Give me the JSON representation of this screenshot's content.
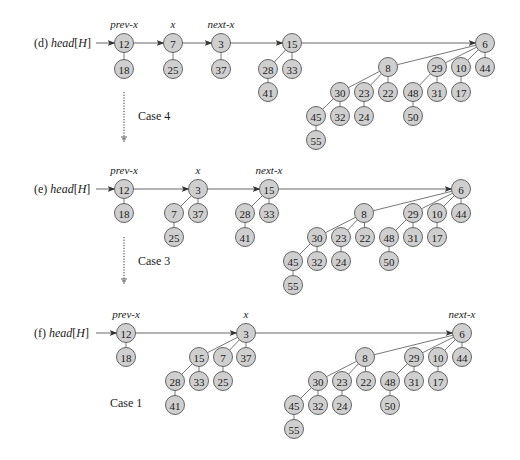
{
  "figure": {
    "colors": {
      "node_fill": "#cfcfcf",
      "node_stroke": "#555555",
      "line": "#555555",
      "text": "#1a1a1a"
    },
    "rows": [
      {
        "id": "d",
        "label_prefix": "(d)",
        "label_main": "head",
        "label_bracket": "[H]",
        "y": 43,
        "pointers": [
          {
            "label": "prev-x",
            "node": "n12"
          },
          {
            "label": "x",
            "node": "n7"
          },
          {
            "label": "next-x",
            "node": "n3"
          }
        ],
        "nodes": [
          {
            "id": "n12",
            "key": "12",
            "x": 124,
            "y": 43
          },
          {
            "id": "n18",
            "key": "18",
            "x": 124,
            "y": 69
          },
          {
            "id": "n7",
            "key": "7",
            "x": 173,
            "y": 43
          },
          {
            "id": "n25",
            "key": "25",
            "x": 173,
            "y": 69
          },
          {
            "id": "n3",
            "key": "3",
            "x": 221,
            "y": 43
          },
          {
            "id": "n37",
            "key": "37",
            "x": 221,
            "y": 69
          },
          {
            "id": "n15",
            "key": "15",
            "x": 292,
            "y": 43
          },
          {
            "id": "n28",
            "key": "28",
            "x": 268,
            "y": 69
          },
          {
            "id": "n33",
            "key": "33",
            "x": 292,
            "y": 69
          },
          {
            "id": "n41",
            "key": "41",
            "x": 268,
            "y": 92
          },
          {
            "id": "n6",
            "key": "6",
            "x": 485,
            "y": 43
          },
          {
            "id": "n8",
            "key": "8",
            "x": 388,
            "y": 67
          },
          {
            "id": "n29",
            "key": "29",
            "x": 437,
            "y": 67
          },
          {
            "id": "n10",
            "key": "10",
            "x": 461,
            "y": 67
          },
          {
            "id": "n44",
            "key": "44",
            "x": 485,
            "y": 67
          },
          {
            "id": "n30",
            "key": "30",
            "x": 340,
            "y": 92
          },
          {
            "id": "n23",
            "key": "23",
            "x": 364,
            "y": 92
          },
          {
            "id": "n22",
            "key": "22",
            "x": 388,
            "y": 92
          },
          {
            "id": "n48",
            "key": "48",
            "x": 413,
            "y": 92
          },
          {
            "id": "n31",
            "key": "31",
            "x": 437,
            "y": 92
          },
          {
            "id": "n17",
            "key": "17",
            "x": 461,
            "y": 92
          },
          {
            "id": "n45",
            "key": "45",
            "x": 316,
            "y": 116
          },
          {
            "id": "n32",
            "key": "32",
            "x": 340,
            "y": 116
          },
          {
            "id": "n24",
            "key": "24",
            "x": 364,
            "y": 116
          },
          {
            "id": "n50",
            "key": "50",
            "x": 413,
            "y": 116
          },
          {
            "id": "n55",
            "key": "55",
            "x": 316,
            "y": 140
          }
        ],
        "edges": [
          [
            "n12",
            "n18"
          ],
          [
            "n7",
            "n25"
          ],
          [
            "n3",
            "n37"
          ],
          [
            "n15",
            "n28"
          ],
          [
            "n15",
            "n33"
          ],
          [
            "n28",
            "n41"
          ],
          [
            "n6",
            "n8"
          ],
          [
            "n6",
            "n29"
          ],
          [
            "n6",
            "n10"
          ],
          [
            "n6",
            "n44"
          ],
          [
            "n8",
            "n30"
          ],
          [
            "n8",
            "n23"
          ],
          [
            "n8",
            "n22"
          ],
          [
            "n29",
            "n48"
          ],
          [
            "n29",
            "n31"
          ],
          [
            "n10",
            "n17"
          ],
          [
            "n30",
            "n45"
          ],
          [
            "n30",
            "n32"
          ],
          [
            "n23",
            "n24"
          ],
          [
            "n48",
            "n50"
          ],
          [
            "n45",
            "n55"
          ]
        ],
        "root_list": [
          "n12",
          "n7",
          "n3",
          "n15",
          "n6"
        ],
        "transition": {
          "label": "Case 4",
          "x": 124,
          "y1": 92,
          "y2": 140,
          "label_x": 138,
          "label_y": 120
        }
      },
      {
        "id": "e",
        "label_prefix": "(e)",
        "label_main": "head",
        "label_bracket": "[H]",
        "y": 189,
        "pointers": [
          {
            "label": "prev-x",
            "node": "n12"
          },
          {
            "label": "x",
            "node": "n3"
          },
          {
            "label": "next-x",
            "node": "n15"
          }
        ],
        "nodes": [
          {
            "id": "n12",
            "key": "12",
            "x": 124,
            "y": 189
          },
          {
            "id": "n18",
            "key": "18",
            "x": 124,
            "y": 213
          },
          {
            "id": "n3",
            "key": "3",
            "x": 198,
            "y": 189
          },
          {
            "id": "n7",
            "key": "7",
            "x": 174,
            "y": 213
          },
          {
            "id": "n37",
            "key": "37",
            "x": 198,
            "y": 213
          },
          {
            "id": "n25",
            "key": "25",
            "x": 174,
            "y": 237
          },
          {
            "id": "n15",
            "key": "15",
            "x": 269,
            "y": 189
          },
          {
            "id": "n28",
            "key": "28",
            "x": 245,
            "y": 213
          },
          {
            "id": "n33",
            "key": "33",
            "x": 269,
            "y": 213
          },
          {
            "id": "n41",
            "key": "41",
            "x": 245,
            "y": 237
          },
          {
            "id": "n6",
            "key": "6",
            "x": 461,
            "y": 189
          },
          {
            "id": "n8",
            "key": "8",
            "x": 364,
            "y": 213
          },
          {
            "id": "n29",
            "key": "29",
            "x": 413,
            "y": 213
          },
          {
            "id": "n10",
            "key": "10",
            "x": 437,
            "y": 213
          },
          {
            "id": "n44",
            "key": "44",
            "x": 461,
            "y": 213
          },
          {
            "id": "n30",
            "key": "30",
            "x": 317,
            "y": 237
          },
          {
            "id": "n23",
            "key": "23",
            "x": 341,
            "y": 237
          },
          {
            "id": "n22",
            "key": "22",
            "x": 365,
            "y": 237
          },
          {
            "id": "n48",
            "key": "48",
            "x": 389,
            "y": 237
          },
          {
            "id": "n31",
            "key": "31",
            "x": 413,
            "y": 237
          },
          {
            "id": "n17",
            "key": "17",
            "x": 437,
            "y": 237
          },
          {
            "id": "n45",
            "key": "45",
            "x": 293,
            "y": 261
          },
          {
            "id": "n32",
            "key": "32",
            "x": 317,
            "y": 261
          },
          {
            "id": "n24",
            "key": "24",
            "x": 341,
            "y": 261
          },
          {
            "id": "n50",
            "key": "50",
            "x": 389,
            "y": 261
          },
          {
            "id": "n55",
            "key": "55",
            "x": 293,
            "y": 285
          }
        ],
        "edges": [
          [
            "n12",
            "n18"
          ],
          [
            "n3",
            "n7"
          ],
          [
            "n3",
            "n37"
          ],
          [
            "n7",
            "n25"
          ],
          [
            "n15",
            "n28"
          ],
          [
            "n15",
            "n33"
          ],
          [
            "n28",
            "n41"
          ],
          [
            "n6",
            "n8"
          ],
          [
            "n6",
            "n29"
          ],
          [
            "n6",
            "n10"
          ],
          [
            "n6",
            "n44"
          ],
          [
            "n8",
            "n30"
          ],
          [
            "n8",
            "n23"
          ],
          [
            "n8",
            "n22"
          ],
          [
            "n29",
            "n48"
          ],
          [
            "n29",
            "n31"
          ],
          [
            "n10",
            "n17"
          ],
          [
            "n30",
            "n45"
          ],
          [
            "n30",
            "n32"
          ],
          [
            "n23",
            "n24"
          ],
          [
            "n48",
            "n50"
          ],
          [
            "n45",
            "n55"
          ]
        ],
        "root_list": [
          "n12",
          "n3",
          "n15",
          "n6"
        ],
        "transition": {
          "label": "Case 3",
          "x": 124,
          "y1": 237,
          "y2": 282,
          "label_x": 138,
          "label_y": 265
        }
      },
      {
        "id": "f",
        "label_prefix": "(f)",
        "label_main": "head",
        "label_bracket": "[H]",
        "y": 333,
        "pointers": [
          {
            "label": "prev-x",
            "node": "n12"
          },
          {
            "label": "x",
            "node": "n3"
          },
          {
            "label": "next-x",
            "node": "n6"
          }
        ],
        "nodes": [
          {
            "id": "n12",
            "key": "12",
            "x": 126,
            "y": 333
          },
          {
            "id": "n18",
            "key": "18",
            "x": 126,
            "y": 357
          },
          {
            "id": "n3",
            "key": "3",
            "x": 246,
            "y": 333
          },
          {
            "id": "n15",
            "key": "15",
            "x": 199,
            "y": 357
          },
          {
            "id": "n7",
            "key": "7",
            "x": 223,
            "y": 357
          },
          {
            "id": "n37",
            "key": "37",
            "x": 246,
            "y": 357
          },
          {
            "id": "n28",
            "key": "28",
            "x": 175,
            "y": 381
          },
          {
            "id": "n33",
            "key": "33",
            "x": 199,
            "y": 381
          },
          {
            "id": "n25",
            "key": "25",
            "x": 223,
            "y": 381
          },
          {
            "id": "n41",
            "key": "41",
            "x": 175,
            "y": 405
          },
          {
            "id": "n6",
            "key": "6",
            "x": 462,
            "y": 333
          },
          {
            "id": "n8",
            "key": "8",
            "x": 365,
            "y": 357
          },
          {
            "id": "n29",
            "key": "29",
            "x": 414,
            "y": 357
          },
          {
            "id": "n10",
            "key": "10",
            "x": 438,
            "y": 357
          },
          {
            "id": "n44",
            "key": "44",
            "x": 462,
            "y": 357
          },
          {
            "id": "n30",
            "key": "30",
            "x": 318,
            "y": 381
          },
          {
            "id": "n23",
            "key": "23",
            "x": 342,
            "y": 381
          },
          {
            "id": "n22",
            "key": "22",
            "x": 366,
            "y": 381
          },
          {
            "id": "n48",
            "key": "48",
            "x": 390,
            "y": 381
          },
          {
            "id": "n31",
            "key": "31",
            "x": 414,
            "y": 381
          },
          {
            "id": "n17",
            "key": "17",
            "x": 438,
            "y": 381
          },
          {
            "id": "n45",
            "key": "45",
            "x": 294,
            "y": 405
          },
          {
            "id": "n32",
            "key": "32",
            "x": 318,
            "y": 405
          },
          {
            "id": "n24",
            "key": "24",
            "x": 342,
            "y": 405
          },
          {
            "id": "n50",
            "key": "50",
            "x": 390,
            "y": 405
          },
          {
            "id": "n55",
            "key": "55",
            "x": 294,
            "y": 429
          }
        ],
        "edges": [
          [
            "n12",
            "n18"
          ],
          [
            "n3",
            "n15"
          ],
          [
            "n3",
            "n7"
          ],
          [
            "n3",
            "n37"
          ],
          [
            "n15",
            "n28"
          ],
          [
            "n15",
            "n33"
          ],
          [
            "n7",
            "n25"
          ],
          [
            "n28",
            "n41"
          ],
          [
            "n6",
            "n8"
          ],
          [
            "n6",
            "n29"
          ],
          [
            "n6",
            "n10"
          ],
          [
            "n6",
            "n44"
          ],
          [
            "n8",
            "n30"
          ],
          [
            "n8",
            "n23"
          ],
          [
            "n8",
            "n22"
          ],
          [
            "n29",
            "n48"
          ],
          [
            "n29",
            "n31"
          ],
          [
            "n10",
            "n17"
          ],
          [
            "n30",
            "n45"
          ],
          [
            "n30",
            "n32"
          ],
          [
            "n23",
            "n24"
          ],
          [
            "n48",
            "n50"
          ],
          [
            "n45",
            "n55"
          ]
        ],
        "root_list": [
          "n12",
          "n3",
          "n6"
        ],
        "case_note": {
          "label": "Case 1",
          "x": 110,
          "y": 407
        }
      }
    ]
  }
}
